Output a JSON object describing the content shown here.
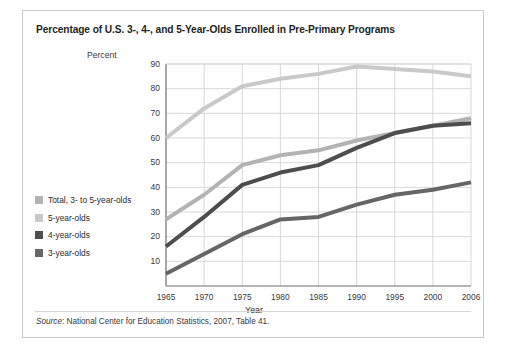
{
  "figure": {
    "title": "Percentage of U.S. 3-, 4-, and 5-Year-Olds Enrolled in Pre-Primary Programs",
    "source_prefix": "Source",
    "source_text": ": National Center for Education Statistics, 2007, Table 41."
  },
  "colors": {
    "total": "#b3b3b3",
    "five": "#c9c9c9",
    "four": "#4d4d4d",
    "three": "#666666",
    "grid": "#d8d8d8",
    "axis": "#8c8c8c",
    "border": "#c9c9c9"
  },
  "legend": {
    "items": [
      {
        "label": "Total, 3- to 5-year-olds",
        "color_key": "total"
      },
      {
        "label": "5-year-olds",
        "color_key": "five"
      },
      {
        "label": "4-year-olds",
        "color_key": "four"
      },
      {
        "label": "3-year-olds",
        "color_key": "three"
      }
    ]
  },
  "chart_data": {
    "type": "line",
    "title": "Percentage of U.S. 3-, 4-, and 5-Year-Olds Enrolled in Pre-Primary Programs",
    "xlabel": "Year",
    "ylabel": "Percent",
    "grid": true,
    "legend_position": "left",
    "x": [
      1965,
      1970,
      1975,
      1980,
      1985,
      1990,
      1995,
      2000,
      2006
    ],
    "xticklabels": [
      "1965",
      "1970",
      "1975",
      "1980",
      "1985",
      "1990",
      "1995",
      "2000",
      "2006"
    ],
    "yticks": [
      10,
      20,
      30,
      40,
      50,
      60,
      70,
      80,
      90
    ],
    "yticklabels": [
      "10",
      "20",
      "30",
      "40",
      "50",
      "60",
      "70",
      "80",
      "90"
    ],
    "xlim": [
      1965,
      2006
    ],
    "ylim": [
      0,
      90
    ],
    "series": [
      {
        "name": "5-year-olds",
        "color": "#c9c9c9",
        "values": [
          60,
          72,
          81,
          84,
          86,
          89,
          88,
          87,
          85
        ]
      },
      {
        "name": "Total, 3- to 5-year-olds",
        "color": "#b3b3b3",
        "values": [
          27,
          37,
          49,
          53,
          55,
          59,
          62,
          65,
          68
        ]
      },
      {
        "name": "4-year-olds",
        "color": "#4d4d4d",
        "values": [
          16,
          28,
          41,
          46,
          49,
          56,
          62,
          65,
          66
        ]
      },
      {
        "name": "3-year-olds",
        "color": "#666666",
        "values": [
          5,
          13,
          21,
          27,
          28,
          33,
          37,
          39,
          42
        ]
      }
    ]
  }
}
